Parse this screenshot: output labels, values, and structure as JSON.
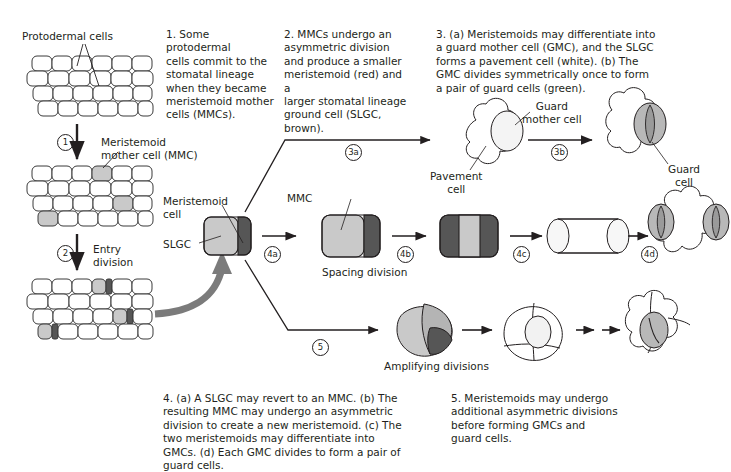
{
  "figure": {
    "colors": {
      "slgc_light_gray": "#c9c9c9",
      "meristemoid_dark_gray": "#565656",
      "guard_cell_gray": "#b8b8b8",
      "pavement_white": "#ffffff",
      "outline": "#231f20",
      "thick_arrow_gray": "#7b7b7b"
    }
  },
  "captions": [
    {
      "id": "caption-1",
      "text": "1. Some protodermal\ncells commit to the\nstomatal lineage\nwhen they became\nmeristemoid mother\ncells (MMCs)."
    },
    {
      "id": "caption-2",
      "text": "2. MMCs undergo an\nasymmetric division\nand produce a smaller\nmeristemoid (red) and a\nlarger stomatal lineage\nground cell (SLGC, brown)."
    },
    {
      "id": "caption-3",
      "text": "3. (a) Meristemoids may differentiate into\na guard mother cell (GMC), and the SLGC\nforms a pavement cell (white). (b) The\nGMC divides symmetrically once to form\na pair of guard cells (green)."
    },
    {
      "id": "caption-4",
      "text": "4. (a) A SLGC may revert to an MMC. (b) The\nresulting MMC may undergo an asymmetric\ndivision to create a new meristemoid. (c) The\ntwo meristemoids may differentiate into\nGMCs. (d) Each GMC divides to form a pair of\nguard cells."
    },
    {
      "id": "caption-5",
      "text": "5. Meristemoids may undergo\nadditional asymmetric divisions\nbefore forming GMCs and\nguard cells."
    }
  ],
  "labels": {
    "protodermal_cells": "Protodermal cells",
    "meristemoid_mother_cell": "Meristemoid\nmother cell (MMC)",
    "entry_division": "Entry\ndivision",
    "meristemoid_cell": "Meristemoid\ncell",
    "slgc": "SLGC",
    "mmc": "MMC",
    "spacing_division": "Spacing division",
    "amplifying_divisions": "Amplifying divisions",
    "guard_mother_cell": "Guard\nmother cell",
    "pavement_cell": "Pavement\ncell",
    "guard_cell": "Guard\ncell"
  },
  "steps": [
    {
      "id": "step-1",
      "label": "1"
    },
    {
      "id": "step-2",
      "label": "2"
    },
    {
      "id": "step-3a",
      "label": "3a"
    },
    {
      "id": "step-3b",
      "label": "3b"
    },
    {
      "id": "step-4a",
      "label": "4a"
    },
    {
      "id": "step-4b",
      "label": "4b"
    },
    {
      "id": "step-4c",
      "label": "4c"
    },
    {
      "id": "step-4d",
      "label": "4d"
    },
    {
      "id": "step-5",
      "label": "5"
    }
  ]
}
